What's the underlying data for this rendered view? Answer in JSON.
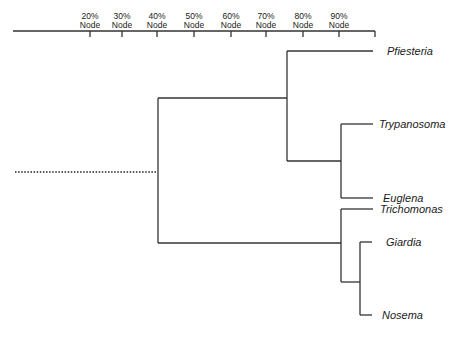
{
  "axis": {
    "ticks": [
      {
        "pct": "20%",
        "label": "Node",
        "x": 90
      },
      {
        "pct": "30%",
        "label": "Node",
        "x": 122
      },
      {
        "pct": "40%",
        "label": "Node",
        "x": 157
      },
      {
        "pct": "50%",
        "label": "Node",
        "x": 194
      },
      {
        "pct": "60%",
        "label": "Node",
        "x": 231
      },
      {
        "pct": "70%",
        "label": "Node",
        "x": 266
      },
      {
        "pct": "80%",
        "label": "Node",
        "x": 303
      },
      {
        "pct": "90%",
        "label": "Node",
        "x": 339
      }
    ]
  },
  "taxa": [
    {
      "name": "Pfiesteria",
      "x": 387,
      "y": 55
    },
    {
      "name": "Trypanosoma",
      "x": 379,
      "y": 128
    },
    {
      "name": "Euglena",
      "x": 383,
      "y": 202
    },
    {
      "name": "Trichomonas",
      "x": 380,
      "y": 213
    },
    {
      "name": "Giardia",
      "x": 386,
      "y": 246
    },
    {
      "name": "Nosema",
      "x": 382,
      "y": 319
    }
  ],
  "colors": {
    "line": "#333333",
    "text": "#1a1a1a",
    "background": "#ffffff"
  }
}
